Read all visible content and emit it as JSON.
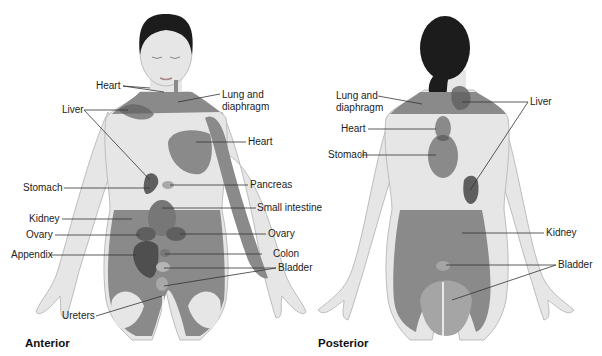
{
  "colors": {
    "skin": "#e6e6e6",
    "skin_outline": "#bdbdbd",
    "hair": "#1c1c1c",
    "referred_zone": "#8a8a8a",
    "organ_dark": "#5f5f5f",
    "organ_light": "#a8a8a8",
    "leader_line": "#333333"
  },
  "anterior": {
    "title": "Anterior",
    "labels": {
      "heart_top": "Heart",
      "lung": "Lung and\ndiaphragm",
      "liver": "Liver",
      "heart": "Heart",
      "stomach": "Stomach",
      "pancreas": "Pancreas",
      "small_intestine": "Small intestine",
      "kidney": "Kidney",
      "ovary_left": "Ovary",
      "ovary_right": "Ovary",
      "appendix": "Appendix",
      "colon": "Colon",
      "bladder": "Bladder",
      "ureters": "Ureters"
    }
  },
  "posterior": {
    "title": "Posterior",
    "labels": {
      "lung": "Lung and\ndiaphragm",
      "liver": "Liver",
      "heart": "Heart",
      "stomach": "Stomach",
      "kidney": "Kidney",
      "bladder": "Bladder"
    }
  }
}
